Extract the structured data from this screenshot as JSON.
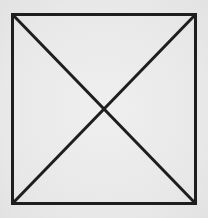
{
  "diagram": {
    "title": "",
    "stroke_color": "#1e1e1e",
    "background_color": "#ebebeb",
    "shapes": [
      {
        "name": "square-outline",
        "type": "rect"
      },
      {
        "name": "diagonal-top-left-to-bottom-right",
        "type": "line"
      },
      {
        "name": "diagonal-top-right-to-bottom-left",
        "type": "line"
      }
    ]
  }
}
